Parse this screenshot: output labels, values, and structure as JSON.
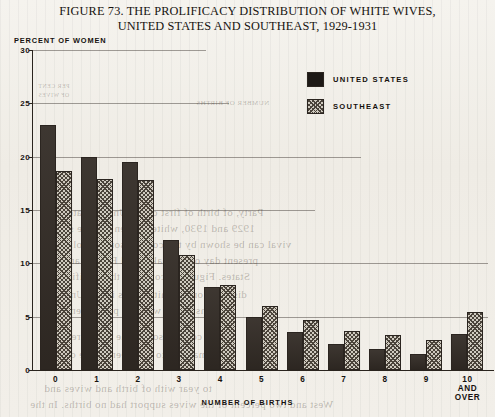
{
  "title": {
    "line1": "FIGURE 73. THE PROLIFICACY DISTRIBUTION OF WHITE WIVES,",
    "line2": "UNITED STATES AND SOUTHEAST, 1929-1931"
  },
  "legend": {
    "items": [
      {
        "label": "UNITED STATES",
        "swatch": "solid-black-swatch",
        "color": "#1d1916"
      },
      {
        "label": "SOUTHEAST",
        "swatch": "hatched-gray-swatch",
        "color": "#cfcabf"
      }
    ]
  },
  "bleed_through": [
    {
      "text": "NUMBER OF BIRTHS",
      "x": 196,
      "y": 99,
      "size": 7
    },
    {
      "text": "PER CENT",
      "x": 38,
      "y": 83,
      "size": 6
    },
    {
      "text": "OF WIVES",
      "x": 38,
      "y": 92,
      "size": 6
    },
    {
      "text": "Party, of birth of first child, United States,",
      "x": 60,
      "y": 206,
      "size": 11
    },
    {
      "text": "1929 and 1930, white women of wife sur-",
      "x": 55,
      "y": 222,
      "size": 11
    },
    {
      "text": "vival can be shown by the comparison of prolificacy",
      "x": 40,
      "y": 238,
      "size": 11
    },
    {
      "text": "present day of the Lakes and Florida and the",
      "x": 45,
      "y": 254,
      "size": 11
    },
    {
      "text": "States. Figure 73 contrasts the prolificacy",
      "x": 50,
      "y": 270,
      "size": 11
    },
    {
      "text": "distribution of white wives in the United",
      "x": 52,
      "y": 288,
      "size": 11
    },
    {
      "text": "demonstrating with the phenomenon",
      "x": 58,
      "y": 304,
      "size": 11
    },
    {
      "text": "and comparison of the whole region",
      "x": 50,
      "y": 330,
      "size": 11
    },
    {
      "text": "of material to had been of the of the",
      "x": 48,
      "y": 348,
      "size": 11
    },
    {
      "text": "to year with of birth and wives and",
      "x": 44,
      "y": 382,
      "size": 11
    },
    {
      "text": "West and two percent of the wives support had no births. In the",
      "x": 30,
      "y": 398,
      "size": 11
    }
  ],
  "chart_data": {
    "type": "bar",
    "title": "FIGURE 73. THE PROLIFICACY DISTRIBUTION OF WHITE WIVES, UNITED STATES AND SOUTHEAST, 1929-1931",
    "xlabel": "NUMBER OF BIRTHS",
    "ylabel": "PERCENT OF WOMEN",
    "categories": [
      "0",
      "1",
      "2",
      "3",
      "4",
      "5",
      "6",
      "7",
      "8",
      "9",
      "10 AND\nOVER"
    ],
    "yticks": [
      0,
      5,
      10,
      15,
      20,
      25,
      30
    ],
    "ytick_labels": [
      "0",
      "5",
      "10",
      "15",
      "20",
      "25",
      "30"
    ],
    "ylim": [
      0,
      30
    ],
    "grid": true,
    "legend_position": "upper-right",
    "series": [
      {
        "name": "UNITED STATES",
        "color": "#332c26",
        "values": [
          23.0,
          20.0,
          19.5,
          12.2,
          7.8,
          5.0,
          3.6,
          2.4,
          2.0,
          1.5,
          3.4
        ]
      },
      {
        "name": "SOUTHEAST",
        "color": "#cfcabf",
        "values": [
          18.7,
          17.9,
          17.8,
          10.8,
          8.0,
          6.0,
          4.7,
          3.7,
          3.3,
          2.8,
          5.4
        ]
      }
    ]
  }
}
